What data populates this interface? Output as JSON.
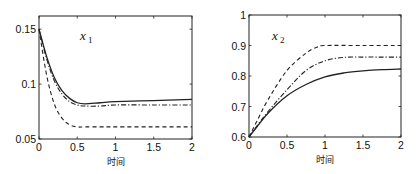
{
  "chart_data": [
    {
      "type": "line",
      "title": "",
      "annotation": "x1",
      "annotation_var": "x",
      "annotation_sub": "1",
      "xlabel": "时间",
      "ylabel": "",
      "xlim": [
        0,
        2
      ],
      "ylim": [
        0.05,
        0.162
      ],
      "xticks": [
        0,
        0.5,
        1,
        1.5,
        2
      ],
      "xtick_labels": [
        "0",
        "0.5",
        "1",
        "1.5",
        "2"
      ],
      "yticks": [
        0.05,
        0.1,
        0.15
      ],
      "ytick_labels": [
        "0.05",
        "0.1",
        "0.15"
      ],
      "grid": false,
      "legend": null,
      "series": [
        {
          "name": "solid",
          "style": "solid",
          "x": [
            0,
            0.1,
            0.2,
            0.3,
            0.4,
            0.5,
            0.6,
            0.8,
            1.0,
            1.5,
            2.0
          ],
          "y": [
            0.15,
            0.125,
            0.106,
            0.094,
            0.087,
            0.083,
            0.082,
            0.083,
            0.084,
            0.085,
            0.086
          ]
        },
        {
          "name": "dash-dot",
          "style": "dashdot",
          "x": [
            0,
            0.1,
            0.2,
            0.3,
            0.4,
            0.5,
            0.6,
            0.8,
            1.0,
            1.5,
            2.0
          ],
          "y": [
            0.15,
            0.123,
            0.103,
            0.091,
            0.084,
            0.081,
            0.08,
            0.08,
            0.081,
            0.081,
            0.081
          ]
        },
        {
          "name": "dashed",
          "style": "dashed",
          "x": [
            0,
            0.1,
            0.2,
            0.3,
            0.4,
            0.5,
            0.6,
            0.8,
            1.0,
            1.5,
            2.0
          ],
          "y": [
            0.15,
            0.108,
            0.082,
            0.069,
            0.063,
            0.061,
            0.061,
            0.061,
            0.061,
            0.061,
            0.061
          ]
        }
      ]
    },
    {
      "type": "line",
      "title": "",
      "annotation": "x2",
      "annotation_var": "x",
      "annotation_sub": "2",
      "xlabel": "时间",
      "ylabel": "",
      "xlim": [
        0,
        2
      ],
      "ylim": [
        0.6,
        1.0
      ],
      "xticks": [
        0,
        0.5,
        1,
        1.5,
        2
      ],
      "xtick_labels": [
        "0",
        "0.5",
        "1",
        "1.5",
        "2"
      ],
      "yticks": [
        0.6,
        0.7,
        0.8,
        0.9,
        1.0
      ],
      "ytick_labels": [
        "0.6",
        "0.7",
        "0.8",
        "0.9",
        "1"
      ],
      "grid": false,
      "legend": null,
      "series": [
        {
          "name": "solid",
          "style": "solid",
          "x": [
            0,
            0.1,
            0.25,
            0.5,
            0.75,
            1.0,
            1.25,
            1.5,
            1.75,
            2.0
          ],
          "y": [
            0.6,
            0.632,
            0.678,
            0.735,
            0.772,
            0.797,
            0.81,
            0.817,
            0.821,
            0.823
          ]
        },
        {
          "name": "dash-dot",
          "style": "dashdot",
          "x": [
            0,
            0.1,
            0.25,
            0.5,
            0.75,
            1.0,
            1.25,
            1.5,
            1.75,
            2.0
          ],
          "y": [
            0.6,
            0.635,
            0.683,
            0.755,
            0.818,
            0.85,
            0.861,
            0.862,
            0.862,
            0.862
          ]
        },
        {
          "name": "dashed",
          "style": "dashed",
          "x": [
            0,
            0.1,
            0.25,
            0.5,
            0.75,
            0.9,
            1.0,
            1.5,
            2.0
          ],
          "y": [
            0.6,
            0.65,
            0.722,
            0.818,
            0.875,
            0.895,
            0.9,
            0.9,
            0.9
          ]
        }
      ]
    }
  ]
}
